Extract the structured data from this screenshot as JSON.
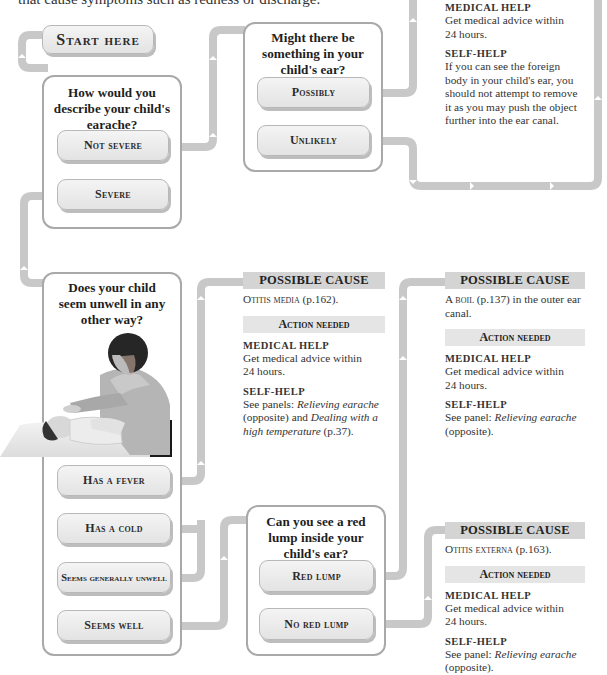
{
  "intro_text": "that cause symptoms such as redness or discharge.",
  "start_button": {
    "label": "Start here"
  },
  "questions": [
    {
      "id": "q1",
      "text": [
        "How would you",
        "describe your child's",
        "earache?"
      ],
      "options": [
        "Not severe",
        "Severe"
      ]
    },
    {
      "id": "q2",
      "text": [
        "Might there be",
        "something in your",
        "child's ear?"
      ],
      "options": [
        "Possibly",
        "Unlikely"
      ]
    },
    {
      "id": "q3",
      "text": [
        "Does your child",
        "seem unwell in any",
        "other way?"
      ],
      "options": [
        "Has a fever",
        "Has a cold",
        "Seems generally unwell",
        "Seems well"
      ],
      "photo": "parent-checking-child-temperature"
    },
    {
      "id": "q4",
      "text": [
        "Can you see a red",
        "lump inside your",
        "child's ear?"
      ],
      "options": [
        "Red lump",
        "No red lump"
      ]
    }
  ],
  "panels": {
    "foreign_body": {
      "medical_help_label": "MEDICAL HELP",
      "medical_help": [
        "Get medical advice within",
        "24 hours."
      ],
      "self_help_label": "SELF-HELP",
      "self_help": [
        "If you can see the foreign",
        "body in your child's ear, you",
        "should not attempt to remove",
        "it as you may push the object",
        "further into the ear canal."
      ]
    },
    "otitis_media": {
      "header": "POSSIBLE CAUSE",
      "cause_name": "Otitis media",
      "cause_ref": " (p.162).",
      "action_header": "Action needed",
      "medical_help_label": "MEDICAL HELP",
      "medical_help": [
        "Get medical advice within",
        "24 hours."
      ],
      "self_help_label": "SELF-HELP",
      "self_help_prefix": "See panels: ",
      "self_help_link1": "Relieving earache",
      "self_help_mid": " (opposite) and ",
      "self_help_link2": "Dealing with a high temperature",
      "self_help_suffix": " (p.37)."
    },
    "boil": {
      "header": "POSSIBLE CAUSE",
      "cause_prefix": "A ",
      "cause_name": "boil",
      "cause_ref": " (p.137) in the outer ear canal.",
      "action_header": "Action needed",
      "medical_help_label": "MEDICAL HELP",
      "medical_help": [
        "Get medical advice within",
        "24 hours."
      ],
      "self_help_label": "SELF-HELP",
      "self_help_prefix": "See panel: ",
      "self_help_link1": "Relieving earache",
      "self_help_suffix": " (opposite)."
    },
    "otitis_externa": {
      "header": "POSSIBLE CAUSE",
      "cause_name": "Otitis externa",
      "cause_ref": " (p.163).",
      "action_header": "Action needed",
      "medical_help_label": "MEDICAL HELP",
      "medical_help": [
        "Get medical advice within",
        "24 hours."
      ],
      "self_help_label": "SELF-HELP",
      "self_help_prefix": "See panel: ",
      "self_help_link1": "Relieving earache",
      "self_help_suffix": " (opposite)."
    }
  },
  "colors": {
    "connector": "#c8c8c8",
    "box_border": "#a9a9a9",
    "header_bg": "#d4d4d4",
    "subheader_bg": "#e5e5e5",
    "button_bg": "#ececec"
  }
}
